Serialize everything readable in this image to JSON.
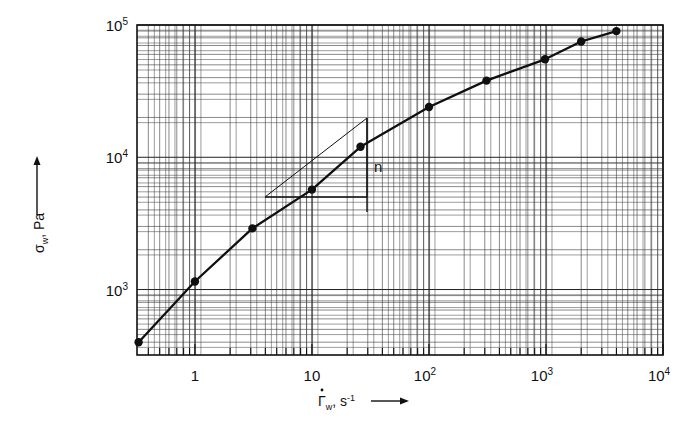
{
  "chart_data": {
    "type": "line",
    "title": "",
    "subtitle": "",
    "xlabel": "Γ̇w, s⁻¹",
    "ylabel": "σw, Pa",
    "xscale": "log",
    "yscale": "log",
    "xlim": [
      0.32,
      10000
    ],
    "ylim": [
      320,
      100000
    ],
    "grid": true,
    "legend": null,
    "x_tick_labels": [
      "1",
      "10",
      "10²",
      "10³",
      "10⁴"
    ],
    "x_tick_values": [
      1,
      10,
      100,
      1000,
      10000
    ],
    "y_tick_labels": [
      "10³",
      "10⁴",
      "10⁵"
    ],
    "y_tick_values": [
      1000,
      10000,
      100000
    ],
    "series": [
      {
        "name": "flow curve",
        "marker": "filled-circle",
        "x": [
          0.33,
          1.0,
          3.1,
          10.0,
          26.0,
          100.0,
          310.0,
          980.0,
          2000.0,
          4000.0
        ],
        "values": [
          400,
          1150,
          2900,
          5700,
          12000,
          24000,
          38000,
          55000,
          75000,
          90000
        ]
      }
    ],
    "annotations": [
      {
        "name": "slope-triangle",
        "label": "n",
        "description": "power-law slope triangle tangent to the curve",
        "x_start": 3.0,
        "x_end": 24.0,
        "y_base": 3200,
        "y_apex": 14500
      }
    ]
  },
  "axes": {
    "x": {
      "title_main": "Γ",
      "title_dot": "·",
      "title_sub": "w",
      "title_unit": ", s",
      "title_unit_sup": "-1",
      "arrow": "→",
      "ticks": [
        {
          "label_base": "1",
          "label_exp": ""
        },
        {
          "label_base": "10",
          "label_exp": ""
        },
        {
          "label_base": "10",
          "label_exp": "2"
        },
        {
          "label_base": "10",
          "label_exp": "3"
        },
        {
          "label_base": "10",
          "label_exp": "4"
        }
      ]
    },
    "y": {
      "title_main": "σ",
      "title_sub": "w",
      "title_unit": ", Pa",
      "arrow": "↑",
      "ticks": [
        {
          "label_base": "10",
          "label_exp": "3"
        },
        {
          "label_base": "10",
          "label_exp": "4"
        },
        {
          "label_base": "10",
          "label_exp": "5"
        }
      ]
    }
  },
  "annotation": {
    "slope_label": "n"
  },
  "style": {
    "line_color": "#101010",
    "marker_color": "#101010",
    "grid_color": "#3a3a3a",
    "frame_color": "#101010",
    "background": "#ffffff"
  }
}
